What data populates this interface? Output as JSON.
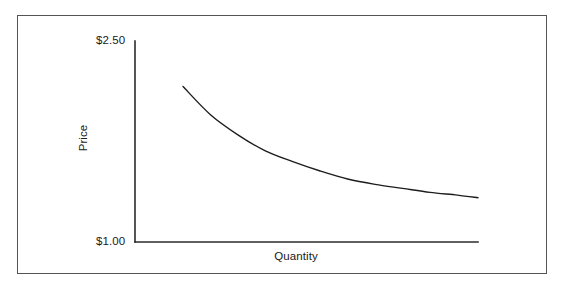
{
  "figure": {
    "frame_color": "#555555",
    "background_color": "#ffffff",
    "line_color": "#1d1d1d"
  },
  "axes": {
    "y_tick_top": "$2.50",
    "y_tick_bottom": "$1.00",
    "y_axis_label": "Price",
    "x_axis_label": "Quantity"
  },
  "chart_data": {
    "type": "line",
    "title": "",
    "subtitle": "",
    "xlabel": "Quantity",
    "ylabel": "Price",
    "ylim": [
      1.0,
      2.5
    ],
    "y_tick_labels": [
      "$1.00",
      "$2.50"
    ],
    "y_tick_values": [
      1.0,
      2.5
    ],
    "x_tick_labels": [],
    "xlim": [
      0,
      100
    ],
    "grid": false,
    "legend": null,
    "legend_position": "none",
    "annotations": [],
    "series": [
      {
        "name": "Demand",
        "x": [
          14,
          22,
          30,
          38,
          46,
          54,
          62,
          70,
          78,
          86,
          94,
          100
        ],
        "values": [
          2.16,
          1.95,
          1.8,
          1.68,
          1.6,
          1.53,
          1.47,
          1.43,
          1.4,
          1.37,
          1.35,
          1.33
        ]
      }
    ]
  }
}
